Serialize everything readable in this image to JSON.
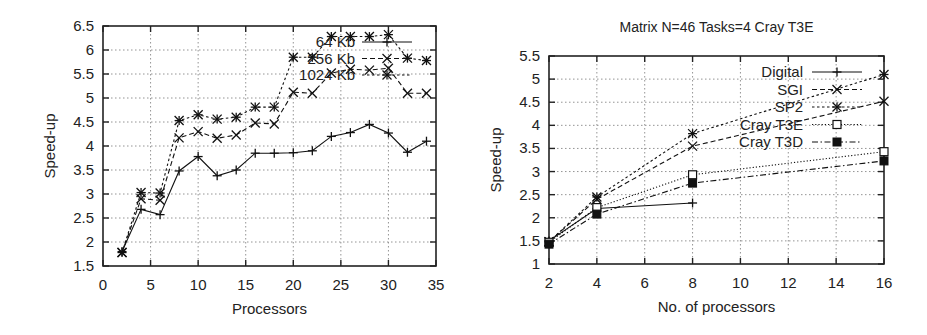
{
  "chart_data": [
    {
      "type": "line",
      "title": "",
      "xlabel": "Processors",
      "ylabel": "Speed-up",
      "xlim": [
        0,
        35
      ],
      "ylim": [
        1.5,
        6.5
      ],
      "xticks": [
        0,
        5,
        10,
        15,
        20,
        25,
        30,
        35
      ],
      "yticks": [
        1.5,
        2,
        2.5,
        3,
        3.5,
        4,
        4.5,
        5,
        5.5,
        6,
        6.5
      ],
      "ytick_labels": [
        "1.5",
        "2",
        "2.5",
        "3",
        "3.5",
        "4",
        "4.5",
        "5",
        "5.5",
        "6",
        "6.5"
      ],
      "grid": true,
      "legend_position": "top-right, inside",
      "x": [
        2,
        4,
        6,
        8,
        10,
        12,
        14,
        16,
        18,
        20,
        22,
        24,
        26,
        28,
        30,
        32,
        34
      ],
      "series": [
        {
          "name": "64 Kb",
          "marker": "plus",
          "line": "solid",
          "values": [
            1.8,
            2.68,
            2.57,
            3.48,
            3.78,
            3.38,
            3.5,
            3.85,
            3.85,
            3.86,
            3.9,
            4.2,
            4.28,
            4.45,
            4.27,
            3.87,
            4.1
          ]
        },
        {
          "name": "256 Kb",
          "marker": "x",
          "line": "dashed",
          "values": [
            1.78,
            2.9,
            2.87,
            4.17,
            4.3,
            4.16,
            4.23,
            4.48,
            4.46,
            5.12,
            5.1,
            5.52,
            5.6,
            5.58,
            5.62,
            5.1,
            5.1
          ]
        },
        {
          "name": "1024 Kb",
          "marker": "asterisk",
          "line": "dotted",
          "values": [
            1.78,
            3.03,
            3.02,
            4.53,
            4.65,
            4.56,
            4.6,
            4.81,
            4.81,
            5.85,
            5.85,
            6.28,
            6.28,
            6.28,
            6.32,
            5.83,
            5.78
          ]
        }
      ]
    },
    {
      "type": "line",
      "title": "Matrix N=46 Tasks=4 Cray T3E",
      "xlabel": "No. of processors",
      "ylabel": "Speed-up",
      "xlim": [
        2,
        16
      ],
      "ylim": [
        1,
        5.5
      ],
      "xticks": [
        2,
        4,
        6,
        8,
        10,
        12,
        14,
        16
      ],
      "yticks": [
        1,
        1.5,
        2,
        2.5,
        3,
        3.5,
        4,
        4.5,
        5,
        5.5
      ],
      "ytick_labels": [
        "1",
        "1.5",
        "2",
        "2.5",
        "3",
        "3.5",
        "4",
        "4.5",
        "5",
        "5.5"
      ],
      "grid": true,
      "legend_position": "top-right, inside",
      "series": [
        {
          "name": "Digital",
          "marker": "plus",
          "line": "solid",
          "x": [
            2,
            4,
            8
          ],
          "values": [
            1.5,
            2.2,
            2.32
          ]
        },
        {
          "name": "SGI",
          "marker": "x",
          "line": "dashed",
          "x": [
            2,
            4,
            8,
            16
          ],
          "values": [
            1.48,
            2.4,
            3.55,
            4.52
          ]
        },
        {
          "name": "SP2",
          "marker": "asterisk",
          "line": "dotted",
          "x": [
            2,
            4,
            8,
            16
          ],
          "values": [
            1.48,
            2.45,
            3.82,
            5.1
          ]
        },
        {
          "name": "Cray T3E",
          "marker": "open-square",
          "line": "fine-dotted",
          "x": [
            2,
            4,
            8,
            16
          ],
          "values": [
            1.47,
            2.22,
            2.93,
            3.43
          ]
        },
        {
          "name": "Cray T3D",
          "marker": "filled-square",
          "line": "dash-dot",
          "x": [
            2,
            4,
            8,
            16
          ],
          "values": [
            1.43,
            2.08,
            2.75,
            3.23
          ]
        }
      ]
    }
  ]
}
